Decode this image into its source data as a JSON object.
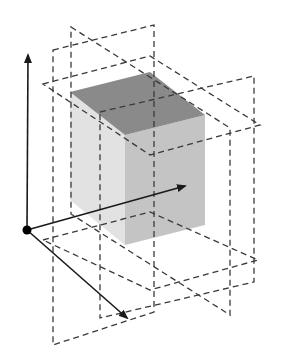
{
  "diagram": {
    "title": "",
    "colors": {
      "background": "#ffffff",
      "cube_top": "#8a8a8a",
      "cube_front": "#c4c4c4",
      "cube_left": "#e2e2e2",
      "axis": "#1a1a1a",
      "dash": "#3a3a3a",
      "origin": "#000000"
    },
    "origin": [
      27,
      230
    ],
    "axes": [
      {
        "name": "y-axis",
        "from": [
          27,
          230
        ],
        "to": [
          28,
          55
        ]
      },
      {
        "name": "x-axis",
        "from": [
          27,
          230
        ],
        "to": [
          185,
          186
        ]
      },
      {
        "name": "z-axis",
        "from": [
          27,
          230
        ],
        "to": [
          127,
          318
        ]
      }
    ],
    "cube": {
      "top": [
        [
          70,
          92
        ],
        [
          125,
          135
        ],
        [
          205,
          115
        ],
        [
          150,
          72
        ]
      ],
      "front": [
        [
          125,
          135
        ],
        [
          205,
          115
        ],
        [
          205,
          225
        ],
        [
          125,
          245
        ]
      ],
      "left": [
        [
          70,
          92
        ],
        [
          125,
          135
        ],
        [
          125,
          245
        ],
        [
          70,
          200
        ]
      ]
    },
    "dashed_planes": [
      {
        "name": "horizontal-plane-upper",
        "points": [
          [
            43,
            84
          ],
          [
            150,
            56
          ],
          [
            260,
            125
          ],
          [
            150,
            155
          ]
        ]
      },
      {
        "name": "horizontal-plane-lower",
        "points": [
          [
            43,
            240
          ],
          [
            150,
            212
          ],
          [
            258,
            260
          ],
          [
            150,
            290
          ]
        ]
      },
      {
        "name": "vertical-plane-frontal-1",
        "points": [
          [
            53,
            50
          ],
          [
            154,
            25
          ],
          [
            154,
            312
          ],
          [
            53,
            345
          ]
        ]
      },
      {
        "name": "vertical-plane-frontal-2",
        "points": [
          [
            100,
            112
          ],
          [
            254,
            76
          ],
          [
            254,
            282
          ],
          [
            100,
            318
          ]
        ]
      },
      {
        "name": "vertical-plane-sagittal",
        "points": [
          [
            71,
            27
          ],
          [
            230,
            128
          ],
          [
            230,
            315
          ],
          [
            71,
            214
          ]
        ]
      }
    ]
  }
}
